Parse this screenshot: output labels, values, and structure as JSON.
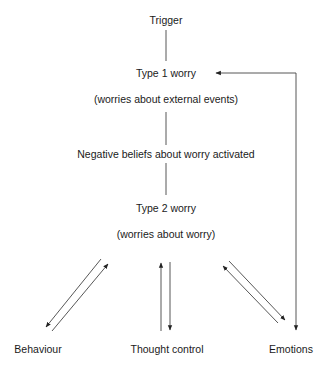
{
  "diagram": {
    "nodes": {
      "trigger": "Trigger",
      "type1": "Type 1 worry",
      "type1_sub": "(worries about external events)",
      "negative_beliefs": "Negative beliefs about worry activated",
      "type2": "Type 2 worry",
      "type2_sub": "(worries about worry)",
      "behaviour": "Behaviour",
      "thought_control": "Thought control",
      "emotions": "Emotions"
    },
    "edges": [
      {
        "from": "trigger",
        "to": "type1",
        "type": "line"
      },
      {
        "from": "type1",
        "to": "negative_beliefs",
        "type": "line"
      },
      {
        "from": "negative_beliefs",
        "to": "type2",
        "type": "line"
      },
      {
        "from": "type2",
        "to": "behaviour",
        "type": "arrow"
      },
      {
        "from": "behaviour",
        "to": "type2",
        "type": "arrow"
      },
      {
        "from": "thought_control",
        "to": "type2",
        "type": "arrow"
      },
      {
        "from": "type2",
        "to": "thought_control",
        "type": "arrow"
      },
      {
        "from": "type2",
        "to": "emotions",
        "type": "arrow"
      },
      {
        "from": "emotions",
        "to": "type2",
        "type": "arrow"
      },
      {
        "from": "emotions",
        "to": "type1",
        "type": "arrow",
        "bidirectional": true
      }
    ],
    "line_color": "#333333"
  }
}
